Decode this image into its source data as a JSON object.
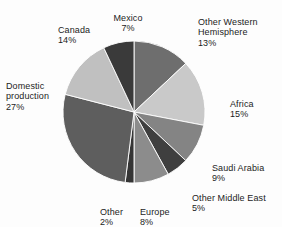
{
  "chart_data": {
    "type": "pie",
    "title": "",
    "xlabel": "",
    "ylabel": "",
    "legend_position": "none",
    "grid": false,
    "units": "percent",
    "categories": [
      "Other Western Hemisphere",
      "Africa",
      "Saudi Arabia",
      "Other Middle East",
      "Europe",
      "Other",
      "Domestic production",
      "Canada",
      "Mexico"
    ],
    "values": [
      13,
      15,
      9,
      5,
      8,
      2,
      27,
      14,
      7
    ],
    "slices": [
      {
        "label": "Other Western Hemisphere",
        "value": 13,
        "value_text": "13%",
        "color": "#6e6e6e"
      },
      {
        "label": "Africa",
        "value": 15,
        "value_text": "15%",
        "color": "#c9c9c9"
      },
      {
        "label": "Saudi Arabia",
        "value": 9,
        "value_text": "9%",
        "color": "#848484"
      },
      {
        "label": "Other Middle East",
        "value": 5,
        "value_text": "5%",
        "color": "#3f3f3f"
      },
      {
        "label": "Europe",
        "value": 8,
        "value_text": "8%",
        "color": "#8c8c8c"
      },
      {
        "label": "Other",
        "value": 2,
        "value_text": "2%",
        "color": "#353535"
      },
      {
        "label": "Domestic production",
        "value": 27,
        "value_text": "27%",
        "color": "#5e5e5e"
      },
      {
        "label": "Canada",
        "value": 14,
        "value_text": "14%",
        "color": "#c0c0c0"
      },
      {
        "label": "Mexico",
        "value": 7,
        "value_text": "7%",
        "color": "#3a3a3a"
      }
    ],
    "start_angle_deg": 0,
    "total": 100
  },
  "labels": {
    "mexico": {
      "name": "Mexico",
      "pct": "7%"
    },
    "owh": {
      "name": "Other Western\nHemisphere",
      "pct": "13%"
    },
    "africa": {
      "name": "Africa",
      "pct": "15%"
    },
    "saudi": {
      "name": "Saudi Arabia",
      "pct": "9%"
    },
    "ome": {
      "name": "Other Middle East",
      "pct": "5%"
    },
    "europe": {
      "name": "Europe",
      "pct": "8%"
    },
    "other": {
      "name": "Other",
      "pct": "2%"
    },
    "domestic": {
      "name": "Domestic\nproduction",
      "pct": "27%"
    },
    "canada": {
      "name": "Canada",
      "pct": "14%"
    }
  },
  "colors": {
    "background": "#fdfdfd",
    "text": "#1c1c1c",
    "slice_light": "#c9c9c9",
    "slice_mid": "#848484",
    "slice_dark": "#3a3a3a"
  }
}
